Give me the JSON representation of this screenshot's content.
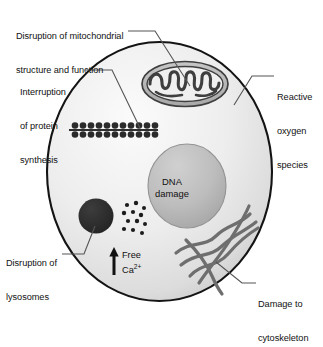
{
  "figure": {
    "background_color": "#ffffff",
    "width": 323,
    "height": 319
  },
  "cell": {
    "name": "cell-body",
    "outline_color": "#1a1a1a",
    "fill_light": "#f2f2f2",
    "fill_shade": "#cfcfcf",
    "bounds": {
      "left": 47,
      "top": 42,
      "right": 272,
      "bottom": 301
    }
  },
  "organelles": {
    "nucleus": {
      "label": "DNA\ndamage",
      "label_line_1": "DNA",
      "label_line_2": "damage",
      "fill": "#b9b9b9",
      "outline": "#8c8c8c"
    },
    "mitochondrion": {
      "name": "mitochondrion",
      "fill": "#b5b5b5",
      "outline": "#4d4d4d"
    },
    "ribosomes": {
      "name": "ribosome-chain",
      "count_pairs": 12,
      "color": "#2e2e2e"
    },
    "lysosome": {
      "name": "lysosome",
      "fill": "#2b2b2b"
    },
    "calcium_granules": {
      "name": "calcium-granules",
      "count": 12,
      "color": "#1c1c1c"
    },
    "cytoskeleton": {
      "name": "cytoskeleton-filaments",
      "filament_count": 5,
      "color": "#6e6e6e"
    }
  },
  "annotations": {
    "free_calcium": {
      "text_line_1": "Free",
      "text_prefix": "Ca",
      "text_superscript": "2+",
      "arrow_direction": "up"
    }
  },
  "labels": [
    {
      "id": "mitochondrial",
      "line_1": "Disruption of mitochondrial",
      "line_2": "structure and function"
    },
    {
      "id": "protein",
      "line_1": "Interruption",
      "line_2": "of protein",
      "line_3": "synthesis"
    },
    {
      "id": "ros",
      "line_1": "Reactive",
      "line_2": "oxygen",
      "line_3": "species"
    },
    {
      "id": "lysosomes",
      "line_1": "Disruption of",
      "line_2": "lysosomes"
    },
    {
      "id": "cytoskeleton",
      "line_1": "Damage to",
      "line_2": "cytoskeleton"
    }
  ],
  "leader_lines": {
    "color": "#555555",
    "count": 5
  }
}
